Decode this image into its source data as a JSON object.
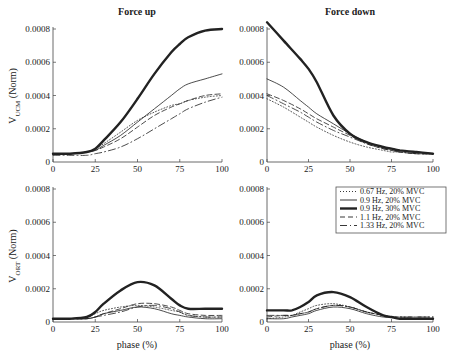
{
  "colors": {
    "line": "#222222",
    "axis": "#444444",
    "legend_border": "#555555"
  },
  "chart_data": [
    {
      "type": "line",
      "panel": "top-left",
      "title": "Force up",
      "xlabel": "",
      "ylabel": "V_UCM (Norm)",
      "xlim": [
        0,
        100
      ],
      "ylim": [
        0,
        0.0008
      ],
      "xticks": [
        "0",
        "25",
        "50",
        "75",
        "100"
      ],
      "yticks": [
        "0",
        "0.0002",
        "0.0004",
        "0.0006",
        "0.0008"
      ],
      "grid": false,
      "x": [
        0,
        10,
        20,
        25,
        30,
        40,
        50,
        60,
        70,
        75,
        80,
        90,
        100
      ],
      "series": [
        {
          "name": "0.67 Hz, 20% MVC",
          "values": [
            5e-05,
            5e-05,
            6e-05,
            8e-05,
            0.00011,
            0.00018,
            0.00025,
            0.0003,
            0.00034,
            0.00035,
            0.00037,
            0.00039,
            0.0004
          ]
        },
        {
          "name": "0.9 Hz, 20% MVC",
          "values": [
            5e-05,
            5e-05,
            6e-05,
            7e-05,
            0.0001,
            0.00016,
            0.00024,
            0.00032,
            0.0004,
            0.00044,
            0.00047,
            0.0005,
            0.00053
          ]
        },
        {
          "name": "0.9 Hz, 30% MVC",
          "values": [
            5e-05,
            5e-05,
            6e-05,
            8e-05,
            0.00013,
            0.00024,
            0.00038,
            0.00053,
            0.00066,
            0.00071,
            0.00075,
            0.00079,
            0.0008
          ]
        },
        {
          "name": "1.1 Hz, 20% MVC",
          "values": [
            5e-05,
            5e-05,
            6e-05,
            7e-05,
            9e-05,
            0.00014,
            0.00021,
            0.00028,
            0.00033,
            0.00035,
            0.00037,
            0.0004,
            0.00041
          ]
        },
        {
          "name": "1.33 Hz, 20% MVC",
          "values": [
            4e-05,
            4e-05,
            4e-05,
            5e-05,
            6e-05,
            9e-05,
            0.00014,
            0.0002,
            0.00026,
            0.00029,
            0.00032,
            0.00036,
            0.00039
          ]
        }
      ]
    },
    {
      "type": "line",
      "panel": "top-right",
      "title": "Force down",
      "xlabel": "",
      "ylabel": "",
      "xlim": [
        0,
        100
      ],
      "ylim": [
        0,
        0.0008
      ],
      "xticks": [
        "0",
        "25",
        "50",
        "75",
        "100"
      ],
      "yticks": [
        "0",
        "0.0002",
        "0.0004",
        "0.0006",
        "0.0008"
      ],
      "grid": false,
      "x": [
        0,
        10,
        20,
        25,
        30,
        40,
        50,
        60,
        70,
        75,
        80,
        90,
        100
      ],
      "series": [
        {
          "name": "0.67 Hz, 20% MVC",
          "values": [
            0.00038,
            0.00033,
            0.00027,
            0.00024,
            0.00021,
            0.00016,
            0.00012,
            9e-05,
            7e-05,
            6e-05,
            6e-05,
            5e-05,
            5e-05
          ]
        },
        {
          "name": "0.9 Hz, 20% MVC",
          "values": [
            0.0005,
            0.00045,
            0.00037,
            0.00033,
            0.00029,
            0.00023,
            0.00017,
            0.00012,
            9e-05,
            8e-05,
            7e-05,
            6e-05,
            5e-05
          ]
        },
        {
          "name": "0.9 Hz, 30% MVC",
          "values": [
            0.00084,
            0.00073,
            0.00062,
            0.00056,
            0.00048,
            0.00028,
            0.00017,
            0.00012,
            9e-05,
            8e-05,
            7e-05,
            6e-05,
            5e-05
          ]
        },
        {
          "name": "1.1 Hz, 20% MVC",
          "values": [
            0.00041,
            0.00037,
            0.00032,
            0.00029,
            0.00026,
            0.00021,
            0.00016,
            0.00011,
            8e-05,
            7e-05,
            6e-05,
            5e-05,
            5e-05
          ]
        },
        {
          "name": "1.33 Hz, 20% MVC",
          "values": [
            0.0004,
            0.00035,
            0.0003,
            0.00027,
            0.00024,
            0.00019,
            0.00015,
            0.00011,
            8e-05,
            7e-05,
            6e-05,
            5e-05,
            5e-05
          ]
        }
      ]
    },
    {
      "type": "line",
      "panel": "bottom-left",
      "title": "",
      "xlabel": "phase (%)",
      "ylabel": "V_ORT (Norm)",
      "xlim": [
        0,
        100
      ],
      "ylim": [
        0,
        0.0008
      ],
      "xticks": [
        "0",
        "25",
        "50",
        "75",
        "100"
      ],
      "yticks": [
        "0",
        "0.0002",
        "0.0004",
        "0.0006",
        "0.0008"
      ],
      "grid": false,
      "x": [
        0,
        10,
        20,
        25,
        30,
        40,
        50,
        60,
        70,
        75,
        80,
        90,
        100
      ],
      "series": [
        {
          "name": "0.67 Hz, 20% MVC",
          "values": [
            2e-05,
            2e-05,
            3e-05,
            5e-05,
            7e-05,
            9e-05,
            0.0001,
            9e-05,
            7e-05,
            6e-05,
            4e-05,
            3e-05,
            3e-05
          ]
        },
        {
          "name": "0.9 Hz, 20% MVC",
          "values": [
            2e-05,
            2e-05,
            2e-05,
            3e-05,
            5e-05,
            7e-05,
            9e-05,
            8e-05,
            5e-05,
            4e-05,
            3e-05,
            2e-05,
            2e-05
          ]
        },
        {
          "name": "0.9 Hz, 30% MVC",
          "values": [
            2e-05,
            2e-05,
            3e-05,
            6e-05,
            0.00011,
            0.00019,
            0.00024,
            0.00022,
            0.00014,
            0.0001,
            8e-05,
            8e-05,
            8e-05
          ]
        },
        {
          "name": "1.1 Hz, 20% MVC",
          "values": [
            2e-05,
            2e-05,
            2e-05,
            3e-05,
            5e-05,
            8e-05,
            0.00011,
            0.00011,
            9e-05,
            7e-05,
            5e-05,
            4e-05,
            4e-05
          ]
        },
        {
          "name": "1.33 Hz, 20% MVC",
          "values": [
            2e-05,
            2e-05,
            2e-05,
            3e-05,
            4e-05,
            6e-05,
            9e-05,
            0.0001,
            8e-05,
            6e-05,
            4e-05,
            3e-05,
            3e-05
          ]
        }
      ]
    },
    {
      "type": "line",
      "panel": "bottom-right",
      "title": "",
      "xlabel": "phase (%)",
      "ylabel": "",
      "xlim": [
        0,
        100
      ],
      "ylim": [
        0,
        0.0008
      ],
      "xticks": [
        "0",
        "25",
        "50",
        "75",
        "100"
      ],
      "yticks": [
        "0",
        "0.0002",
        "0.0004",
        "0.0006",
        "0.0008"
      ],
      "grid": false,
      "x": [
        0,
        10,
        15,
        20,
        25,
        30,
        40,
        50,
        60,
        70,
        75,
        80,
        90,
        100
      ],
      "series": [
        {
          "name": "0.67 Hz, 20% MVC",
          "values": [
            2e-05,
            3e-05,
            4e-05,
            6e-05,
            8e-05,
            0.0001,
            0.00011,
            9e-05,
            6e-05,
            4e-05,
            3e-05,
            3e-05,
            2e-05,
            2e-05
          ]
        },
        {
          "name": "0.9 Hz, 20% MVC",
          "values": [
            2e-05,
            2e-05,
            3e-05,
            4e-05,
            5e-05,
            7e-05,
            9e-05,
            8e-05,
            5e-05,
            3e-05,
            3e-05,
            2e-05,
            2e-05,
            2e-05
          ]
        },
        {
          "name": "0.9 Hz, 30% MVC",
          "values": [
            7e-05,
            7e-05,
            7e-05,
            9e-05,
            0.00012,
            0.00016,
            0.00018,
            0.00015,
            9e-05,
            4e-05,
            3e-05,
            2e-05,
            2e-05,
            2e-05
          ]
        },
        {
          "name": "1.1 Hz, 20% MVC",
          "values": [
            3e-05,
            4e-05,
            4e-05,
            5e-05,
            6e-05,
            8e-05,
            0.0001,
            9e-05,
            6e-05,
            4e-05,
            3e-05,
            3e-05,
            3e-05,
            3e-05
          ]
        },
        {
          "name": "1.33 Hz, 20% MVC",
          "values": [
            4e-05,
            4e-05,
            4e-05,
            5e-05,
            6e-05,
            8e-05,
            0.0001,
            9e-05,
            6e-05,
            4e-05,
            3e-05,
            3e-05,
            3e-05,
            3e-05
          ]
        }
      ]
    }
  ],
  "legend": {
    "position": "bottom-right panel, upper right",
    "entries": [
      {
        "label": "0.67 Hz, 20% MVC",
        "style": "dotted"
      },
      {
        "label": "0.9 Hz, 20% MVC",
        "style": "thin-solid"
      },
      {
        "label": "0.9 Hz, 30% MVC",
        "style": "thick-solid"
      },
      {
        "label": "1.1 Hz, 20% MVC",
        "style": "short-dash"
      },
      {
        "label": "1.33 Hz, 20% MVC",
        "style": "dash-dot"
      }
    ]
  },
  "panels": {
    "top_left_title": "Force up",
    "top_right_title": "Force down",
    "top_ylabel_main": "V",
    "top_ylabel_sub": "UCM",
    "top_ylabel_rest": " (Norm)",
    "bottom_ylabel_main": "V",
    "bottom_ylabel_sub": "ORT",
    "bottom_ylabel_rest": " (Norm)",
    "xlabel": "phase (%)"
  }
}
